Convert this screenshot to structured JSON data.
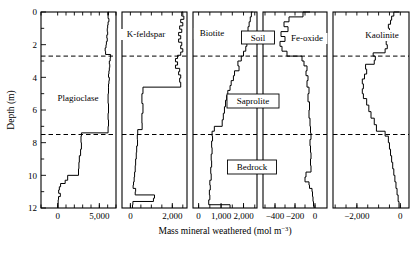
{
  "figure": {
    "axis_title_main": "Mass mineral weathered (mol m",
    "axis_title_exp": "−3",
    "axis_title_tail": ")",
    "y_axis_label": "Depth (m)",
    "y_ticks": [
      "0",
      "2",
      "4",
      "6",
      "8",
      "10",
      "12"
    ],
    "y_range": [
      0,
      12
    ],
    "zone_boundaries": [
      2.7,
      7.5
    ],
    "zones": [
      {
        "name": "Soil",
        "label": "Soil"
      },
      {
        "name": "Saprolite",
        "label": "Saprolite"
      },
      {
        "name": "Bedrock",
        "label": "Bedrock"
      }
    ]
  },
  "chart_data": {
    "type": "line",
    "title": "",
    "xlabel": "Mass mineral weathered (mol m−3)",
    "ylabel": "Depth (m)",
    "ylim": [
      0,
      12
    ],
    "y_invert": true,
    "grid": false,
    "legend": "none",
    "annotations": [
      "Soil",
      "Saprolite",
      "Bedrock"
    ],
    "panels": [
      {
        "name": "plagioclase",
        "label": "Plagioclase",
        "xlim": [
          -2000,
          7000
        ],
        "xticks": [
          0,
          5000
        ],
        "xticklabels": [
          "0",
          "5,000"
        ],
        "xminorticks": [
          -2000,
          0,
          1000,
          2000,
          3000,
          4000,
          5000,
          6000,
          7000
        ],
        "series": [
          {
            "name": "Plagioclase mass weathered",
            "depths": [
              0.0,
              0.2,
              0.4,
              0.6,
              0.8,
              1.0,
              1.2,
              1.4,
              1.6,
              1.8,
              2.0,
              2.2,
              2.4,
              2.6,
              2.8,
              3.0,
              3.2,
              3.4,
              3.6,
              3.8,
              4.0,
              4.2,
              4.4,
              4.6,
              5.0,
              5.6,
              6.2,
              6.6,
              7.0,
              7.4,
              7.6,
              8.0,
              8.4,
              8.8,
              9.2,
              9.6,
              10.0,
              10.3,
              10.5,
              10.7,
              10.9,
              11.1,
              11.3,
              11.5,
              11.8,
              12.0
            ],
            "values": [
              6150,
              6100,
              6050,
              6150,
              6050,
              6000,
              5950,
              6000,
              5900,
              5950,
              5850,
              5800,
              5700,
              5750,
              6350,
              6300,
              6200,
              6250,
              6200,
              6150,
              6100,
              6200,
              6150,
              6100,
              6100,
              6050,
              6100,
              6050,
              6100,
              6050,
              2850,
              2800,
              2850,
              2750,
              2600,
              2550,
              2500,
              1200,
              900,
              350,
              200,
              120,
              320,
              100,
              60,
              50
            ]
          }
        ]
      },
      {
        "name": "k-feldspar",
        "label": "K-feldspar",
        "xlim": [
          -400,
          2700
        ],
        "xticks": [
          0,
          2000
        ],
        "xticklabels": [
          "0",
          "2,000"
        ],
        "xminorticks": [
          0,
          500,
          1000,
          1500,
          2000,
          2500
        ],
        "series": [
          {
            "name": "K-feldspar mass weathered",
            "depths": [
              0.0,
              0.25,
              0.45,
              0.65,
              0.85,
              1.05,
              1.25,
              1.45,
              1.65,
              1.85,
              2.05,
              2.25,
              2.45,
              2.65,
              2.85,
              3.05,
              3.25,
              3.45,
              3.65,
              3.85,
              4.05,
              4.3,
              4.6,
              5.0,
              5.6,
              6.2,
              6.8,
              7.2,
              7.5,
              7.8,
              8.2,
              8.6,
              9.0,
              9.4,
              9.8,
              10.1,
              10.4,
              10.6,
              10.8,
              11.0,
              11.2,
              11.4,
              11.6,
              11.8,
              12.0
            ],
            "values": [
              2500,
              2450,
              2550,
              2400,
              2500,
              2350,
              2450,
              2300,
              2400,
              2300,
              2450,
              2400,
              2500,
              2400,
              2250,
              2150,
              2250,
              2150,
              2350,
              2300,
              2400,
              2350,
              2400,
              600,
              550,
              600,
              550,
              560,
              350,
              330,
              340,
              300,
              280,
              250,
              230,
              200,
              180,
              150,
              130,
              250,
              230,
              1150,
              1100,
              120,
              100
            ]
          }
        ]
      },
      {
        "name": "biotite",
        "label": "Biotite",
        "xlim": [
          -250,
          2600
        ],
        "xticks": [
          0,
          1000,
          2000
        ],
        "xticklabels": [
          "0",
          "1,000",
          "2,000"
        ],
        "xminorticks": [
          0,
          500,
          1000,
          1500,
          2000,
          2500
        ],
        "series": [
          {
            "name": "Biotite mass weathered",
            "depths": [
              0.0,
              0.3,
              0.6,
              0.9,
              1.2,
              1.5,
              1.8,
              2.1,
              2.4,
              2.7,
              3.0,
              3.3,
              3.6,
              3.9,
              4.2,
              4.5,
              4.8,
              5.1,
              5.4,
              5.8,
              6.2,
              6.6,
              7.0,
              7.3,
              7.6,
              7.9,
              8.3,
              8.7,
              9.1,
              9.5,
              9.9,
              10.3,
              10.6,
              10.9,
              11.2,
              11.5,
              11.8,
              12.0
            ],
            "values": [
              2400,
              2350,
              2300,
              2250,
              2200,
              2150,
              2100,
              2150,
              2100,
              2000,
              1900,
              1750,
              1800,
              1600,
              1550,
              1450,
              1400,
              1300,
              1250,
              1200,
              1150,
              1100,
              1050,
              700,
              600,
              620,
              580,
              600,
              560,
              580,
              540,
              560,
              500,
              520,
              480,
              500,
              450,
              1400
            ]
          }
        ]
      },
      {
        "name": "fe-oxide",
        "label": "Fe-oxide",
        "xlim": [
          -520,
          120
        ],
        "xticks": [
          -400,
          -200,
          0
        ],
        "xticklabels": [
          "−400",
          "−200",
          "0"
        ],
        "xminorticks": [
          -500,
          -400,
          -300,
          -200,
          -100,
          0
        ],
        "series": [
          {
            "name": "Fe-oxide mass weathered",
            "depths": [
              0.0,
              0.3,
              0.6,
              0.9,
              1.2,
              1.5,
              1.8,
              2.1,
              2.4,
              2.7,
              3.0,
              3.3,
              3.6,
              3.9,
              4.2,
              4.6,
              5.0,
              5.5,
              6.0,
              6.5,
              7.0,
              7.4,
              7.8,
              8.2,
              8.6,
              9.0,
              9.4,
              9.8,
              10.1,
              10.4,
              10.6,
              10.8,
              11.0,
              11.3,
              11.6,
              11.9,
              12.0
            ],
            "values": [
              -50,
              -120,
              -260,
              -310,
              -270,
              -340,
              -300,
              -350,
              -330,
              -280,
              -130,
              -110,
              -80,
              -90,
              -70,
              -80,
              -60,
              -70,
              -55,
              -60,
              -50,
              -45,
              -40,
              -50,
              -45,
              -40,
              -45,
              -40,
              -90,
              -100,
              -60,
              -55,
              -30,
              -25,
              -20,
              -15,
              -10
            ]
          }
        ]
      },
      {
        "name": "kaolinite",
        "label": "Kaolinite",
        "xlim": [
          -3100,
          400
        ],
        "xticks": [
          -2000,
          0
        ],
        "xticklabels": [
          "−2,000",
          "0"
        ],
        "xminorticks": [
          -3000,
          -2500,
          -2000,
          -1500,
          -1000,
          -500,
          0
        ],
        "series": [
          {
            "name": "Kaolinite mass weathered",
            "depths": [
              0.0,
              0.25,
              0.5,
              0.75,
              1.0,
              1.25,
              1.5,
              1.75,
              2.0,
              2.25,
              2.5,
              2.7,
              2.95,
              3.2,
              3.5,
              3.8,
              4.1,
              4.4,
              4.7,
              5.0,
              5.3,
              5.7,
              6.1,
              6.5,
              6.9,
              7.3,
              7.6,
              8.0,
              8.4,
              8.8,
              9.2,
              9.6,
              10.0,
              10.4,
              10.8,
              11.2,
              11.6,
              12.0
            ],
            "values": [
              -50,
              -300,
              -400,
              -450,
              -550,
              -500,
              -600,
              -550,
              -650,
              -600,
              -700,
              -1250,
              -1150,
              -1200,
              -1600,
              -1550,
              -1650,
              -1750,
              -1700,
              -1750,
              -1700,
              -1550,
              -1450,
              -1350,
              -1200,
              -1100,
              -700,
              -550,
              -500,
              -450,
              -400,
              -350,
              -300,
              -250,
              -200,
              -150,
              -100,
              -60
            ]
          }
        ]
      }
    ]
  }
}
